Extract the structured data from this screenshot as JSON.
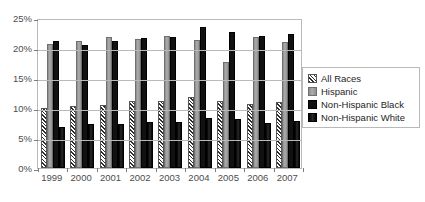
{
  "chart_data": {
    "type": "bar",
    "title": "",
    "subtitle": "",
    "xlabel": "",
    "ylabel": "",
    "categories": [
      "1999",
      "2000",
      "2001",
      "2002",
      "2003",
      "2004",
      "2005",
      "2006",
      "2007"
    ],
    "ylim": [
      0,
      25
    ],
    "ytick_values": [
      0,
      5,
      10,
      15,
      20,
      25
    ],
    "ytick_labels": [
      "0%",
      "5%",
      "10%",
      "15%",
      "20%",
      "25%"
    ],
    "grid": true,
    "legend_position": "right",
    "value_suffix": "%",
    "series": [
      {
        "name": "All Races",
        "swatch": "diagonal-hatch",
        "color": "#2b2b2b",
        "values": [
          10.0,
          10.4,
          10.5,
          11.1,
          11.2,
          11.8,
          11.1,
          10.7,
          11.0
        ]
      },
      {
        "name": "Hispanic",
        "swatch": "light-gray",
        "color": "#9a9a9a",
        "values": [
          20.7,
          21.2,
          21.8,
          21.5,
          22.0,
          21.4,
          17.6,
          21.8,
          21.0
        ]
      },
      {
        "name": "Non-Hispanic Black",
        "swatch": "black",
        "color": "#111111",
        "values": [
          21.1,
          20.5,
          21.2,
          21.6,
          21.9,
          23.5,
          22.6,
          22.0,
          22.4
        ]
      },
      {
        "name": "Non-Hispanic White",
        "swatch": "dark-gray",
        "color": "#161616",
        "values": [
          6.8,
          7.3,
          7.4,
          7.7,
          7.6,
          8.4,
          8.1,
          7.5,
          7.8
        ]
      }
    ]
  }
}
